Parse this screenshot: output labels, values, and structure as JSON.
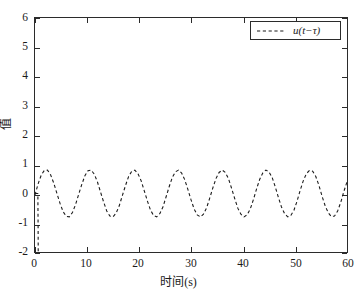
{
  "chart_data": {
    "type": "line",
    "title": "",
    "xlabel": "时间(s)",
    "ylabel": "值",
    "xlim": [
      0,
      60
    ],
    "ylim": [
      -2,
      6
    ],
    "xticks": [
      "0",
      "10",
      "20",
      "30",
      "40",
      "50",
      "60"
    ],
    "yticks": [
      "6",
      "5",
      "4",
      "3",
      "2",
      "1",
      "0",
      "-1",
      "-2"
    ],
    "grid": false,
    "legend_position": "top-right",
    "legend": [
      {
        "label": "u(t−τ)",
        "linestyle": "dashed",
        "color": "#1a1a1a"
      }
    ],
    "series": [
      {
        "name": "u(t−τ)",
        "linestyle": "dashed",
        "color": "#1a1a1a",
        "description": "Initial vertical transient dropping from 0 to -2 at t~0.6s, then a steady sinusoidal oscillation of amplitude ~0.8 about a mean of ~0.05 with period ~6.3 s (about 9.5 cycles across 0-60 s).",
        "initial_transient": {
          "t": [
            0.0,
            0.55,
            0.6,
            0.62,
            0.9
          ],
          "y": [
            0.0,
            0.0,
            -1.2,
            -2.0,
            -2.0
          ]
        },
        "x": [
          0.0,
          0.6,
          1.2,
          1.8,
          2.4,
          3.0,
          3.6,
          4.2,
          4.8,
          5.4,
          6.0,
          6.6,
          7.2,
          7.8,
          8.4,
          9.0,
          9.6,
          10.2,
          10.8,
          11.4,
          12.0,
          12.6,
          13.2,
          13.8,
          14.4,
          15.0,
          15.6,
          16.2,
          16.8,
          17.4,
          18.0,
          18.6,
          19.2,
          19.8,
          20.4,
          21.0,
          21.6,
          22.2,
          22.8,
          23.4,
          24.0,
          24.6,
          25.2,
          25.8,
          26.4,
          27.0,
          27.6,
          28.2,
          28.8,
          29.4,
          30.0,
          30.6,
          31.2,
          31.8,
          32.4,
          33.0,
          33.6,
          34.2,
          34.8,
          35.4,
          36.0,
          36.6,
          37.2,
          37.8,
          38.4,
          39.0,
          39.6,
          40.2,
          40.8,
          41.4,
          42.0,
          42.6,
          43.2,
          43.8,
          44.4,
          45.0,
          45.6,
          46.2,
          46.8,
          47.4,
          48.0,
          48.6,
          49.2,
          49.8,
          50.4,
          51.0,
          51.6,
          52.2,
          52.8,
          53.4,
          54.0,
          54.6,
          55.2,
          55.8,
          56.4,
          57.0,
          57.6,
          58.2,
          58.8,
          59.4,
          60.0
        ],
        "y": [
          -0.05,
          0.33,
          0.63,
          0.79,
          0.8,
          0.64,
          0.36,
          0.01,
          -0.33,
          -0.62,
          -0.78,
          -0.8,
          -0.65,
          -0.38,
          -0.03,
          0.31,
          0.61,
          0.78,
          0.8,
          0.66,
          0.4,
          0.05,
          -0.29,
          -0.6,
          -0.77,
          -0.8,
          -0.67,
          -0.42,
          -0.07,
          0.27,
          0.58,
          0.76,
          0.8,
          0.68,
          0.44,
          0.1,
          -0.25,
          -0.56,
          -0.75,
          -0.8,
          -0.69,
          -0.46,
          -0.12,
          0.23,
          0.55,
          0.74,
          0.8,
          0.7,
          0.47,
          0.14,
          -0.21,
          -0.53,
          -0.73,
          -0.8,
          -0.71,
          -0.49,
          -0.16,
          0.19,
          0.51,
          0.72,
          0.8,
          0.72,
          0.51,
          0.18,
          -0.17,
          -0.5,
          -0.71,
          -0.8,
          -0.73,
          -0.53,
          -0.21,
          0.15,
          0.48,
          0.7,
          0.8,
          0.74,
          0.55,
          0.23,
          -0.13,
          -0.46,
          -0.69,
          -0.8,
          -0.75,
          -0.57,
          -0.26,
          0.11,
          0.44,
          0.68,
          0.79,
          0.76,
          0.58,
          0.28,
          -0.09,
          -0.42,
          -0.66,
          -0.79,
          -0.77,
          -0.6,
          -0.3,
          0.07,
          0.4
        ]
      }
    ]
  },
  "axes": {
    "ylabel": "值",
    "xlabel": "时间(s)"
  },
  "legend_box": {
    "label": "u(t−τ)"
  },
  "colors": {
    "line": "#1a1a1a",
    "frame": "#2b2b2b",
    "background": "#ffffff"
  }
}
